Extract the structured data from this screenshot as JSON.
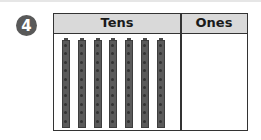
{
  "problem": {
    "number": "4"
  },
  "table": {
    "headers": [
      "Tens",
      "Ones"
    ],
    "tens_rods": 7,
    "ones_cubes": 0
  },
  "colors": {
    "badge": "#595959",
    "header_bg": "#d9d9d9",
    "border": "#333333",
    "rod": "#5a5a5a"
  }
}
